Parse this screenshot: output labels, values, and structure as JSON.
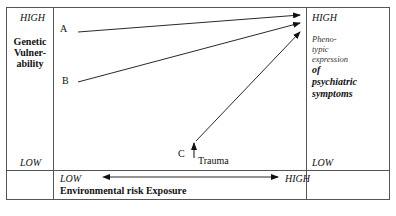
{
  "left_axis": {
    "high": "HIGH",
    "low": "LOW",
    "title_lines": [
      "Genetic",
      "Vulner-",
      "ability"
    ]
  },
  "right_axis": {
    "high": "HIGH",
    "low": "LOW",
    "subtitle_lines": [
      "Pheno-",
      "typic",
      "expression"
    ],
    "title_lines": [
      "of",
      "psychiatric",
      "symptoms"
    ]
  },
  "bottom_axis": {
    "low": "LOW",
    "high": "HIGH",
    "title": "Environmental risk Exposure"
  },
  "pathways": [
    {
      "label": "A"
    },
    {
      "label": "B"
    },
    {
      "label": "C",
      "annotation": "Trauma"
    }
  ],
  "colors": {
    "line": "#111111",
    "border": "#555555"
  }
}
